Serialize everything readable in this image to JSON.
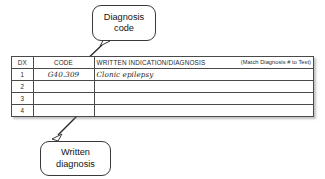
{
  "document": {
    "kind": "medical-requisition-diagnosis-section"
  },
  "colors": {
    "rule": "#4a4a4a",
    "text": "#2b2b2b",
    "callout_border": "#3a3a3a",
    "background": "#ffffff"
  },
  "table": {
    "headers": {
      "dx": "DX",
      "code": "CODE",
      "written": "WRITTEN INDICATION/DIAGNOSIS",
      "note": "(Match Diagnosis # to Test)"
    },
    "rows": [
      {
        "dx": "1",
        "code": "G40.309",
        "written": "Clonic epilepsy"
      },
      {
        "dx": "2",
        "code": "",
        "written": ""
      },
      {
        "dx": "3",
        "code": "",
        "written": ""
      },
      {
        "dx": "4",
        "code": "",
        "written": ""
      }
    ]
  },
  "callouts": [
    {
      "id": "diagnosis-code",
      "line1": "Diagnosis",
      "line2": "code"
    },
    {
      "id": "written-diagnosis",
      "line1": "Written",
      "line2": "diagnosis"
    }
  ]
}
